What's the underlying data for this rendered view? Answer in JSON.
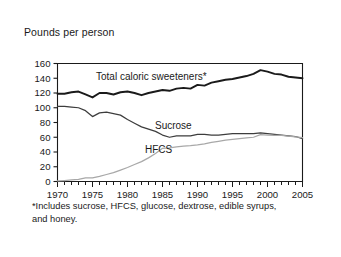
{
  "figure": {
    "axis_title": "Pounds per person",
    "footnote": "*Includes sucrose, HFCS, glucose, dextrose, edible syrups, and honey."
  },
  "labels": {
    "total": "Total caloric sweeteners*",
    "sucrose": "Sucrose",
    "hfcs": "HFCS"
  },
  "colors": {
    "total": "#1a1a1a",
    "sucrose": "#3d3d3d",
    "hfcs": "#a8a8a8",
    "axis": "#1a1a1a",
    "frame": "#c9c9c9",
    "background": "#ffffff"
  },
  "chart_data": {
    "type": "line",
    "title": "",
    "xlabel": "",
    "ylabel": "Pounds per person",
    "xlim": [
      1970,
      2005
    ],
    "ylim": [
      0,
      160
    ],
    "ytick_step": 20,
    "yticks": [
      0,
      20,
      40,
      60,
      80,
      100,
      120,
      140,
      160
    ],
    "xticks": [
      1970,
      1975,
      1980,
      1985,
      1990,
      1995,
      2000,
      2005
    ],
    "xtick_minor_step": 1,
    "grid": false,
    "legend": "inline-labels",
    "annotations": [
      "*Includes sucrose, HFCS, glucose, dextrose, edible syrups, and honey."
    ],
    "x": [
      1970,
      1971,
      1972,
      1973,
      1974,
      1975,
      1976,
      1977,
      1978,
      1979,
      1980,
      1981,
      1982,
      1983,
      1984,
      1985,
      1986,
      1987,
      1988,
      1989,
      1990,
      1991,
      1992,
      1993,
      1994,
      1995,
      1996,
      1997,
      1998,
      1999,
      2000,
      2001,
      2002,
      2003,
      2004,
      2005
    ],
    "series": [
      {
        "name": "Total caloric sweeteners*",
        "values": [
          119,
          119,
          121,
          122,
          118,
          114,
          120,
          120,
          118,
          121,
          122,
          120,
          117,
          120,
          122,
          124,
          123,
          126,
          127,
          126,
          131,
          130,
          134,
          136,
          138,
          139,
          141,
          143,
          146,
          151,
          149,
          146,
          145,
          142,
          141,
          140
        ]
      },
      {
        "name": "Sucrose",
        "values": [
          102,
          102,
          101,
          100,
          96,
          88,
          93,
          94,
          92,
          90,
          84,
          79,
          74,
          71,
          68,
          63,
          60,
          62,
          62,
          62,
          64,
          64,
          63,
          63,
          64,
          65,
          65,
          65,
          65,
          66,
          65,
          64,
          63,
          62,
          61,
          58
        ]
      },
      {
        "name": "HFCS",
        "values": [
          0.7,
          1.3,
          2.1,
          3.0,
          5.0,
          5.0,
          7.0,
          9.5,
          12.0,
          15.5,
          19.0,
          23.0,
          27.0,
          32.0,
          38.0,
          45.0,
          45.5,
          47.0,
          48.0,
          48.5,
          49.5,
          51.0,
          53.0,
          54.5,
          56.0,
          57.0,
          58.0,
          59.0,
          60.0,
          63.5,
          63.0,
          62.5,
          62.5,
          61.5,
          60.5,
          59.5
        ]
      }
    ]
  }
}
